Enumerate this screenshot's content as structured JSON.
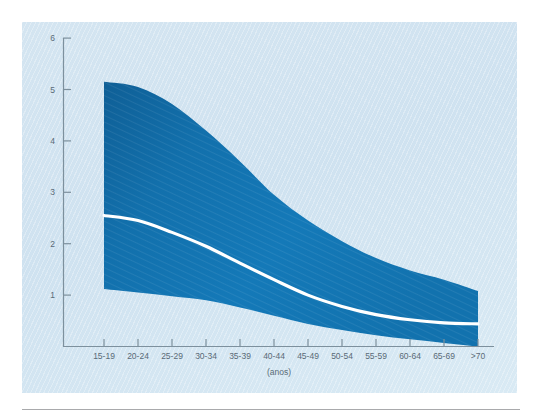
{
  "figure": {
    "panel_bg": "#d3e4f0",
    "band_color": "#1272b0",
    "band_color_dark": "#0f5f96",
    "median_color": "#ffffff",
    "axis_color": "#7d909d",
    "text_color": "#5a6b77",
    "rule_color": "#a9aaac"
  },
  "chart_data": {
    "type": "area",
    "title": "",
    "subtitle": "",
    "xlabel": "(anos)",
    "ylabel": "",
    "categories": [
      "15-19",
      "20-24",
      "25-29",
      "30-34",
      "35-39",
      "40-44",
      "45-49",
      "50-54",
      "55-59",
      "60-64",
      "65-69",
      ">70"
    ],
    "x_tick_labels": [
      "15-19",
      "20-24",
      "25-29",
      "30-34",
      "35-39",
      "40-44",
      "45-49",
      "50-54",
      "55-59",
      "60-64",
      "65-69",
      ">70"
    ],
    "y_tick_labels": [
      "1",
      "2",
      "3",
      "4",
      "5",
      "6"
    ],
    "y_ticks": [
      1,
      2,
      3,
      4,
      5,
      6
    ],
    "ylim": [
      0,
      6.2
    ],
    "grid": false,
    "legend_position": "none",
    "series": [
      {
        "name": "upper",
        "values": [
          5.15,
          5.05,
          4.72,
          4.2,
          3.6,
          2.95,
          2.45,
          2.05,
          1.72,
          1.48,
          1.3,
          1.08
        ]
      },
      {
        "name": "median",
        "values": [
          2.55,
          2.45,
          2.22,
          1.95,
          1.62,
          1.3,
          1.0,
          0.78,
          0.62,
          0.52,
          0.46,
          0.44
        ]
      },
      {
        "name": "lower",
        "values": [
          1.12,
          1.05,
          0.98,
          0.9,
          0.76,
          0.6,
          0.44,
          0.32,
          0.22,
          0.14,
          0.07,
          0.0
        ]
      }
    ]
  }
}
